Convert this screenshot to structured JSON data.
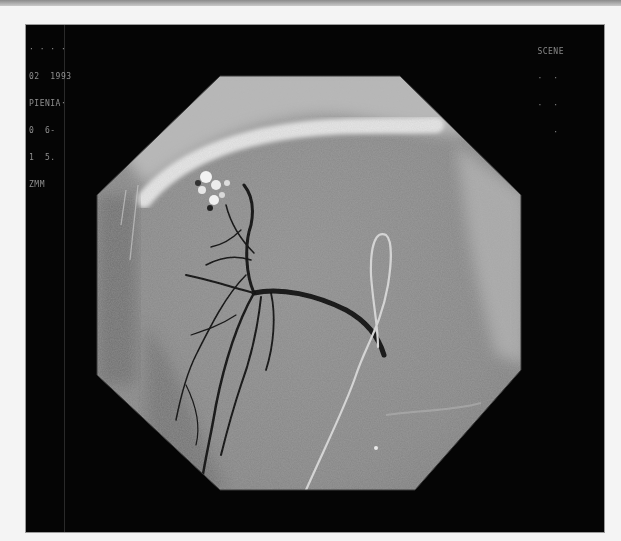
{
  "image": {
    "type": "angiography-fluoroscopy",
    "description": "Grayscale digital subtraction angiogram in an octagonal field of view on a black panel, with contrast-filled branching vessels and a curved catheter loop",
    "background_color": "#f4f4f4",
    "panel_color": "#050505",
    "field_color": "#8c8c8c"
  },
  "overlay": {
    "left_lines": [
      "· · · ·",
      "02  1993",
      "PIENIA·",
      "0  6-",
      "1  5.",
      "ZMM"
    ],
    "right_lines": [
      "SCENE",
      "·  ·",
      "·  ·",
      "   ·"
    ]
  }
}
